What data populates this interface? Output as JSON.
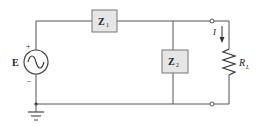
{
  "diagram": {
    "type": "circuit-schematic",
    "source": {
      "label": "E",
      "plus": "+",
      "minus": "–",
      "kind": "ac-voltage-source"
    },
    "z1": {
      "label": "Z",
      "subscript": "1"
    },
    "z2": {
      "label": "Z",
      "subscript": "2"
    },
    "load": {
      "label": "R",
      "subscript": "L"
    },
    "current": {
      "label": "I"
    },
    "colors": {
      "wire": "#555555",
      "box_fill": "#e6e6e6",
      "box_stroke": "#777777",
      "text": "#222222"
    }
  }
}
